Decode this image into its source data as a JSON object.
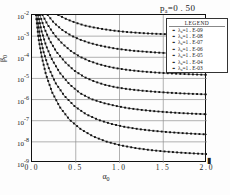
{
  "figure": {
    "title_prefix": "p",
    "title_sub": "a",
    "title_value": "=0 . 50",
    "x_axis_label_main": "α",
    "x_axis_label_sub": "0",
    "y_axis_label_main": "β",
    "y_axis_label_sub": "0",
    "arrow_glyph": "▮"
  },
  "legend": {
    "heading": "LEGEND",
    "marker": "▪ ▪",
    "entries": [
      {
        "symbol": "λ",
        "sub": "a",
        "text": "=1 . E-09"
      },
      {
        "symbol": "λ",
        "sub": "a",
        "text": "=1 . E-08"
      },
      {
        "symbol": "λ",
        "sub": "a",
        "text": "=1 . E-07"
      },
      {
        "symbol": "λ",
        "sub": "a",
        "text": "=1 . E-06"
      },
      {
        "symbol": "λ",
        "sub": "a",
        "text": "=1 . E-05"
      },
      {
        "symbol": "λ",
        "sub": "a",
        "text": "=1 . E-04"
      },
      {
        "symbol": "λ",
        "sub": "a",
        "text": "=1 . E-03"
      }
    ]
  },
  "axes": {
    "y_ticks": [
      "10-2",
      "10-3",
      "10-4",
      "10-5",
      "10-6",
      "10-7",
      "10-8",
      "10-9"
    ],
    "y_tick_bases": [
      "10",
      "10",
      "10",
      "10",
      "10",
      "10",
      "10",
      "10"
    ],
    "y_tick_exps": [
      "-2",
      "-3",
      "-4",
      "-5",
      "-6",
      "-7",
      "-8",
      "-9"
    ],
    "x_ticks": [
      "0 . 0",
      "0 . 5",
      "1 . 0",
      "1 . 5",
      "2 . 0"
    ]
  },
  "chart_data": {
    "type": "line",
    "title": "pa=0 . 50",
    "xlabel": "α0",
    "ylabel": "β0",
    "xlim": [
      0.0,
      2.0
    ],
    "ylim": [
      1e-09,
      0.01
    ],
    "yscale": "log",
    "xscale": "linear",
    "grid": true,
    "legend_position": "upper-right",
    "x_ticks": [
      0.0,
      0.5,
      1.0,
      1.5,
      2.0
    ],
    "y_ticks": [
      1e-09,
      1e-08,
      1e-07,
      1e-06,
      1e-05,
      0.0001,
      0.001,
      0.01
    ],
    "marker": "square",
    "series": [
      {
        "name": "λa=1 . E-03",
        "value": 0.001,
        "x": [
          0.3,
          0.4,
          0.5,
          0.6,
          0.7,
          0.8,
          0.9,
          1.0,
          1.1,
          1.2,
          1.3,
          1.4,
          1.5,
          1.6,
          1.7,
          1.8,
          1.9,
          2.0
        ],
        "y": [
          0.01,
          0.0062,
          0.0043,
          0.0032,
          0.0026,
          0.0022,
          0.0019,
          0.0017,
          0.00155,
          0.00145,
          0.00136,
          0.0013,
          0.00125,
          0.00121,
          0.00117,
          0.00114,
          0.00112,
          0.0011
        ]
      },
      {
        "name": "λa=1 . E-04",
        "value": 0.0001,
        "x": [
          0.18,
          0.25,
          0.35,
          0.45,
          0.55,
          0.65,
          0.75,
          0.85,
          0.95,
          1.05,
          1.15,
          1.25,
          1.4,
          1.55,
          1.7,
          1.85,
          2.0
        ],
        "y": [
          0.01,
          0.0043,
          0.0019,
          0.00105,
          0.00068,
          0.00049,
          0.00038,
          0.00031,
          0.00026,
          0.00023,
          0.000205,
          0.00019,
          0.00017,
          0.000157,
          0.000147,
          0.00014,
          0.000135
        ]
      },
      {
        "name": "λa=1 . E-05",
        "value": 1e-05,
        "x": [
          0.12,
          0.18,
          0.26,
          0.35,
          0.45,
          0.55,
          0.65,
          0.75,
          0.85,
          0.95,
          1.1,
          1.25,
          1.4,
          1.55,
          1.7,
          1.85,
          2.0
        ],
        "y": [
          0.01,
          0.0034,
          0.0011,
          0.00043,
          0.00019,
          0.000105,
          6.8e-05,
          4.9e-05,
          3.8e-05,
          3.1e-05,
          2.5e-05,
          2.15e-05,
          1.92e-05,
          1.76e-05,
          1.64e-05,
          1.55e-05,
          1.48e-05
        ]
      },
      {
        "name": "λa=1 . E-06",
        "value": 1e-06,
        "x": [
          0.09,
          0.14,
          0.2,
          0.28,
          0.38,
          0.48,
          0.6,
          0.72,
          0.84,
          0.96,
          1.1,
          1.25,
          1.4,
          1.55,
          1.7,
          1.85,
          2.0
        ],
        "y": [
          0.01,
          0.0024,
          0.00065,
          0.00018,
          5.8e-05,
          2.4e-05,
          1.15e-05,
          7e-06,
          4.9e-06,
          3.8e-06,
          3.1e-06,
          2.65e-06,
          2.35e-06,
          2.13e-06,
          1.97e-06,
          1.85e-06,
          1.76e-06
        ]
      },
      {
        "name": "λa=1 . E-07",
        "value": 1e-07,
        "x": [
          0.07,
          0.11,
          0.16,
          0.23,
          0.32,
          0.43,
          0.55,
          0.68,
          0.82,
          0.96,
          1.1,
          1.25,
          1.4,
          1.55,
          1.7,
          1.85,
          2.0
        ],
        "y": [
          0.01,
          0.0017,
          0.00036,
          7.6e-05,
          1.8e-05,
          5.2e-06,
          2e-06,
          1.05e-06,
          6.8e-07,
          5e-07,
          3.9e-07,
          3.25e-07,
          2.82e-07,
          2.52e-07,
          2.3e-07,
          2.14e-07,
          2.02e-07
        ]
      },
      {
        "name": "λa=1 . E-08",
        "value": 1e-08,
        "x": [
          0.055,
          0.09,
          0.13,
          0.19,
          0.27,
          0.37,
          0.49,
          0.62,
          0.76,
          0.91,
          1.06,
          1.22,
          1.38,
          1.54,
          1.7,
          1.86,
          2.0
        ],
        "y": [
          0.01,
          0.0011,
          0.00019,
          3.2e-05,
          6e-06,
          1.5e-06,
          4.7e-07,
          2e-07,
          1.09e-07,
          7e-08,
          5.1e-08,
          4e-08,
          3.35e-08,
          2.92e-08,
          2.62e-08,
          2.4e-08,
          2.25e-08
        ]
      },
      {
        "name": "λa=1 . E-09",
        "value": 1e-09,
        "x": [
          0.045,
          0.075,
          0.11,
          0.16,
          0.23,
          0.32,
          0.43,
          0.56,
          0.7,
          0.85,
          1.01,
          1.18,
          1.35,
          1.52,
          1.69,
          1.86,
          2.0
        ],
        "y": [
          0.01,
          0.00075,
          0.00011,
          1.5e-05,
          2.2e-06,
          4.3e-07,
          1.1e-07,
          3.9e-08,
          1.8e-08,
          1.03e-08,
          6.9e-09,
          5.1e-09,
          4.1e-09,
          3.5e-09,
          3.1e-09,
          2.82e-09,
          2.63e-09
        ]
      }
    ]
  }
}
